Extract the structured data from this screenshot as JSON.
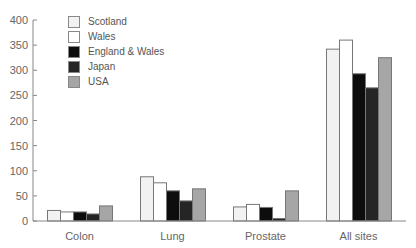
{
  "chart_data": {
    "type": "bar",
    "title": "",
    "xlabel": "",
    "ylabel": "",
    "categories": [
      "Colon",
      "Lung",
      "Prostate",
      "All sites"
    ],
    "series": [
      {
        "name": "Scotland",
        "color": "#f2f2f2",
        "values": [
          21,
          88,
          28,
          342
        ]
      },
      {
        "name": "Wales",
        "color": "#ffffff",
        "values": [
          18,
          76,
          33,
          360
        ]
      },
      {
        "name": "England & Wales",
        "color": "#0d0d0d",
        "values": [
          18,
          60,
          27,
          293
        ]
      },
      {
        "name": "Japan",
        "color": "#252525",
        "values": [
          14,
          40,
          5,
          265
        ]
      },
      {
        "name": "USA",
        "color": "#a6a6a6",
        "values": [
          30,
          64,
          60,
          325
        ]
      }
    ],
    "ylim": [
      0,
      400
    ],
    "yticks": [
      0,
      50,
      100,
      150,
      200,
      250,
      300,
      350,
      400
    ],
    "grid": false,
    "legend_position": "upper left"
  },
  "legend": {
    "items": [
      {
        "label": "Scotland"
      },
      {
        "label": "Wales"
      },
      {
        "label": "England & Wales"
      },
      {
        "label": "Japan"
      },
      {
        "label": "USA"
      }
    ]
  }
}
